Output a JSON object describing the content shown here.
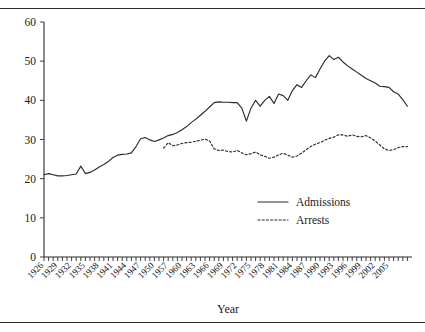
{
  "figure": {
    "background": "#ffffff",
    "ink_color": "#2b2b2b",
    "top_rule": true,
    "bottom_rule": true
  },
  "chart_data": {
    "type": "line",
    "title": "",
    "subtitle": "",
    "xlabel": "Year",
    "ylabel": "",
    "xlim": [
      1926,
      2006
    ],
    "ylim": [
      0,
      60
    ],
    "grid": false,
    "legend_position": "center-right",
    "y_ticks": [
      0,
      10,
      20,
      30,
      40,
      50,
      60
    ],
    "y_tick_labels": [
      "0",
      "10",
      "20",
      "30",
      "40",
      "50",
      "60"
    ],
    "x_tick_labels": [
      "1926",
      "1929",
      "1932",
      "1935",
      "1938",
      "1941",
      "1944",
      "1947",
      "1950",
      "1957",
      "1960",
      "1963",
      "1966",
      "1969",
      "1972",
      "1975",
      "1978",
      "1981",
      "1984",
      "1987",
      "1990",
      "1993",
      "1996",
      "1999",
      "2002",
      "2005"
    ],
    "x_tick_label_years": [
      1926,
      1929,
      1932,
      1935,
      1938,
      1941,
      1944,
      1947,
      1950,
      1953,
      1956,
      1959,
      1962,
      1965,
      1968,
      1971,
      1974,
      1977,
      1980,
      1983,
      1986,
      1989,
      1992,
      1995,
      1998,
      2001
    ],
    "x_minor_tick_years": [
      1926,
      1927,
      1928,
      1929,
      1930,
      1931,
      1932,
      1933,
      1934,
      1935,
      1936,
      1937,
      1938,
      1939,
      1940,
      1941,
      1942,
      1943,
      1944,
      1945,
      1946,
      1947,
      1948,
      1949,
      1950,
      1951,
      1952,
      1953,
      1954,
      1955,
      1956,
      1957,
      1958,
      1959,
      1960,
      1961,
      1962,
      1963,
      1964,
      1965,
      1966,
      1967,
      1968,
      1969,
      1970,
      1971,
      1972,
      1973,
      1974,
      1975,
      1976,
      1977,
      1978,
      1979,
      1980,
      1981,
      1982,
      1983,
      1984,
      1985,
      1986,
      1987,
      1988,
      1989,
      1990,
      1991,
      1992,
      1993,
      1994,
      1995,
      1996,
      1997,
      1998,
      1999,
      2000,
      2001,
      2002,
      2003,
      2004,
      2005
    ],
    "series": [
      {
        "name": "Admissions",
        "style": "solid",
        "x": [
          1926,
          1927,
          1928,
          1929,
          1930,
          1931,
          1932,
          1933,
          1934,
          1935,
          1936,
          1937,
          1938,
          1939,
          1940,
          1941,
          1942,
          1943,
          1944,
          1945,
          1946,
          1947,
          1948,
          1949,
          1950,
          1951,
          1952,
          1953,
          1954,
          1955,
          1956,
          1957,
          1958,
          1959,
          1960,
          1961,
          1962,
          1963,
          1964,
          1965,
          1966,
          1967,
          1968,
          1969,
          1970,
          1971,
          1972,
          1973,
          1974,
          1975,
          1976,
          1977,
          1978,
          1979,
          1980,
          1981,
          1982,
          1983,
          1984,
          1985,
          1986,
          1987,
          1988,
          1989,
          1990,
          1991,
          1992,
          1993,
          1994,
          1995,
          1996,
          1997,
          1998,
          1999,
          2000,
          2001,
          2002,
          2003,
          2004,
          2005
        ],
        "y": [
          21.0,
          21.3,
          21.0,
          20.7,
          20.7,
          20.8,
          21.0,
          21.2,
          23.2,
          21.3,
          21.6,
          22.2,
          23.0,
          23.6,
          24.4,
          25.4,
          26.0,
          26.2,
          26.3,
          26.6,
          28.2,
          30.2,
          30.5,
          29.9,
          29.5,
          29.9,
          30.4,
          31.0,
          31.3,
          31.8,
          32.5,
          33.3,
          34.3,
          35.2,
          36.2,
          37.2,
          38.3,
          39.4,
          39.6,
          39.5,
          39.5,
          39.4,
          39.4,
          38.0,
          34.7,
          38.0,
          40.0,
          38.5,
          40.0,
          41.0,
          39.2,
          41.6,
          41.2,
          40.0,
          42.5,
          44.0,
          43.3,
          45.0,
          46.5,
          45.8,
          48.0,
          50.0,
          51.4,
          50.4,
          51.0,
          49.8,
          48.8,
          48.0,
          47.2,
          46.4,
          45.6,
          45.0,
          44.4,
          43.6,
          43.5,
          43.3,
          42.2,
          41.6,
          40.2,
          38.5
        ]
      },
      {
        "name": "Arrests",
        "style": "dotted",
        "x": [
          1952,
          1953,
          1954,
          1955,
          1956,
          1957,
          1958,
          1959,
          1960,
          1961,
          1962,
          1963,
          1964,
          1965,
          1966,
          1967,
          1968,
          1969,
          1970,
          1971,
          1972,
          1973,
          1974,
          1975,
          1976,
          1977,
          1978,
          1979,
          1980,
          1981,
          1982,
          1983,
          1984,
          1985,
          1986,
          1987,
          1988,
          1989,
          1990,
          1991,
          1992,
          1993,
          1994,
          1995,
          1996,
          1997,
          1998,
          1999,
          2000,
          2001,
          2002,
          2003,
          2004,
          2005
        ],
        "y": [
          27.8,
          29.2,
          28.4,
          28.6,
          29.0,
          29.2,
          29.3,
          29.6,
          29.8,
          30.1,
          29.6,
          27.6,
          27.2,
          27.3,
          26.9,
          26.8,
          27.2,
          26.6,
          26.1,
          26.4,
          26.8,
          26.1,
          25.7,
          25.2,
          25.5,
          26.1,
          26.5,
          26.0,
          25.5,
          25.8,
          26.5,
          27.4,
          28.2,
          28.8,
          29.2,
          29.8,
          30.3,
          30.6,
          31.2,
          31.2,
          30.8,
          31.2,
          30.8,
          30.7,
          31.0,
          30.4,
          29.6,
          28.6,
          27.6,
          27.2,
          27.4,
          27.9,
          28.2,
          28.2
        ]
      }
    ]
  },
  "legend": {
    "entries": [
      {
        "label": "Admissions",
        "style": "solid"
      },
      {
        "label": "Arrests",
        "style": "dotted"
      }
    ]
  }
}
